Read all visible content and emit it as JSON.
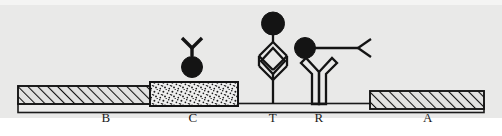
{
  "figure": {
    "background_color": "#e9e9e8",
    "page_color": "#ffffff",
    "line_color": "#1a1a1a",
    "fill_dark": "#111111"
  },
  "labels": [
    {
      "id": "B",
      "text": "B",
      "x": 106,
      "y": 120,
      "meaning": "sample-pad"
    },
    {
      "id": "C",
      "text": "C",
      "x": 192,
      "y": 120,
      "meaning": "conjugate-pad"
    },
    {
      "id": "T",
      "text": "T",
      "x": 273,
      "y": 120,
      "meaning": "test-line"
    },
    {
      "id": "R",
      "text": "R",
      "x": 318,
      "y": 120,
      "meaning": "control-line"
    },
    {
      "id": "A",
      "text": "A",
      "x": 428,
      "y": 120,
      "meaning": "absorbent-pad"
    }
  ],
  "blocks": [
    {
      "id": "B",
      "pattern": "diagonal-hatch",
      "x": 18,
      "y": 86,
      "w": 132,
      "h": 18
    },
    {
      "id": "C",
      "pattern": "stipple",
      "x": 150,
      "y": 82,
      "w": 88,
      "h": 24
    },
    {
      "id": "A",
      "pattern": "diagonal-hatch",
      "x": 370,
      "y": 92,
      "w": 114,
      "h": 18
    }
  ],
  "membrane": {
    "x": 18,
    "y": 104,
    "w": 466,
    "h": 8,
    "pattern": "plain"
  },
  "complexes": [
    {
      "id": "conjugate-antibody",
      "type": "antibody-filled-y-up-with-bead",
      "label_ref": "C",
      "x": 192,
      "bead": {
        "cx": 192,
        "cy": 66,
        "r": 10,
        "filled": true
      },
      "arm_style": "solid-thick"
    },
    {
      "id": "test-line-sandwich",
      "type": "diamond-sandwich-with-bead",
      "label_ref": "T",
      "x": 273,
      "bead": {
        "cx": 273,
        "cy": 23,
        "r": 11,
        "filled": true
      },
      "arm_style": "outline"
    },
    {
      "id": "control-line-capture",
      "type": "outline-y-up-plus-horizontal-y-with-bead",
      "label_ref": "R",
      "x": 318,
      "bead": {
        "cx": 305,
        "cy": 48,
        "r": 10,
        "filled": true
      },
      "arm_style": "outline"
    }
  ]
}
